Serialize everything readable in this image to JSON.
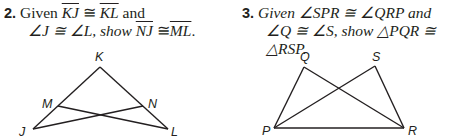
{
  "problems": [
    {
      "number": "2.",
      "given_word": "Given",
      "given1_a": "KJ",
      "cong": "≅",
      "given1_b": "KL",
      "and_word": "and",
      "angle_line": "∠J ≅ ∠L, show",
      "show_a": "NJ",
      "show_b": "ML",
      "period": ".",
      "figure": {
        "labels": {
          "K": "K",
          "M": "M",
          "N": "N",
          "J": "J",
          "L": "L"
        }
      }
    },
    {
      "number": "3.",
      "line1": "Given ∠SPR ≅ ∠QRP and",
      "line2": "∠Q ≅ ∠S, show △PQR ≅ △RSP.",
      "figure": {
        "labels": {
          "Q": "Q",
          "S": "S",
          "P": "P",
          "R": "R"
        }
      }
    }
  ]
}
